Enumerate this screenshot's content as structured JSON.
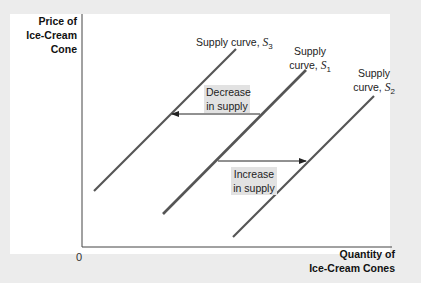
{
  "axes": {
    "y_label_lines": [
      "Price of",
      "Ice-Cream",
      "Cone"
    ],
    "x_label_lines": [
      "Quantity of",
      "Ice-Cream Cones"
    ],
    "origin": "0"
  },
  "curves": [
    {
      "id": "S3",
      "label_prefix": "Supply curve, ",
      "symbol": "S",
      "sub": "3"
    },
    {
      "id": "S1",
      "label_line1": "Supply",
      "label_prefix": "curve, ",
      "symbol": "S",
      "sub": "1"
    },
    {
      "id": "S2",
      "label_line1": "Supply",
      "label_prefix": "curve, ",
      "symbol": "S",
      "sub": "2"
    }
  ],
  "annotations": {
    "decrease": [
      "Decrease",
      "in supply"
    ],
    "increase": [
      "Increase",
      "in supply"
    ]
  },
  "colors": {
    "curve": "#555555",
    "label_box": "#e2e2e2",
    "background": "#ececec"
  }
}
